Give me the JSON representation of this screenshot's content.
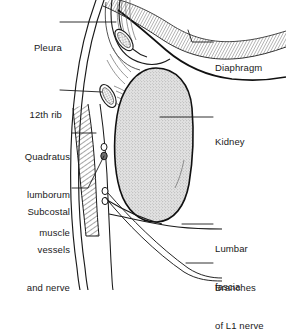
{
  "figure": {
    "background_color": "#ffffff",
    "ink_color": "#1a1a1a",
    "kidney_fill_color": "#d9d9d9",
    "width": 286,
    "height": 290
  },
  "labels": {
    "pleura": {
      "text": "Pleura",
      "lines": [
        "Pleura"
      ],
      "align": "right",
      "x": 8,
      "y": 17,
      "width": 54
    },
    "twelfth_rib": {
      "text": "12th rib",
      "lines": [
        "12th rib"
      ],
      "align": "right",
      "x": 8,
      "y": 84,
      "width": 54
    },
    "quadratus_lumborum": {
      "text": "Quadratus lumborum muscle",
      "lines": [
        "Quadratus",
        "lumborum",
        "muscle"
      ],
      "align": "right",
      "x": 0,
      "y": 126,
      "width": 70
    },
    "subcostal": {
      "text": "Subcostal vessels and nerve",
      "lines": [
        "Subcostal",
        "vessels",
        "and nerve"
      ],
      "align": "right",
      "x": 0,
      "y": 181,
      "width": 70
    },
    "diaphragm": {
      "text": "Diaphragm",
      "lines": [
        "Diaphragm"
      ],
      "align": "left",
      "x": 215,
      "y": 37,
      "width": 70
    },
    "kidney": {
      "text": "Kidney",
      "lines": [
        "Kidney"
      ],
      "align": "left",
      "x": 215,
      "y": 111,
      "width": 70
    },
    "lumbar_fascia": {
      "text": "Lumbar fascia",
      "lines": [
        "Lumbar",
        "fascia"
      ],
      "align": "left",
      "x": 215,
      "y": 218,
      "width": 70
    },
    "branches_l1": {
      "text": "Branches of L1 nerve",
      "lines": [
        "Branches",
        "of L1 nerve"
      ],
      "align": "left",
      "x": 215,
      "y": 257,
      "width": 72
    }
  },
  "structures": [
    {
      "name": "pleura",
      "kind": "membrane-line",
      "description": "pleural reflection line descending obliquely"
    },
    {
      "name": "diaphragm",
      "kind": "hatched-band",
      "description": "hatched muscular band sweeping from upper-left to right"
    },
    {
      "name": "eleventh-rib",
      "kind": "bone-cross-section",
      "description": "small stippled oval rib cross-section, upper"
    },
    {
      "name": "twelfth-rib",
      "kind": "bone-cross-section",
      "description": "small stippled oval rib cross-section, lower"
    },
    {
      "name": "kidney",
      "kind": "stippled-organ",
      "description": "large stippled kidney outline"
    },
    {
      "name": "quadratus-lumborum-muscle",
      "kind": "hatched-band",
      "description": "diagonally hatched vertical muscle band on left"
    },
    {
      "name": "subcostal-vessels-and-nerve",
      "kind": "small-circles",
      "description": "paired small circles in the wall"
    },
    {
      "name": "branches-of-l1-nerve",
      "kind": "small-circles",
      "description": "paired small circles lower in the wall"
    },
    {
      "name": "lumbar-fascia",
      "kind": "fascial-line",
      "description": "fascial lines running medially from the wall"
    }
  ],
  "leader_lines": {
    "pleura": "from label to pleural reflection near upper rib",
    "twelfth_rib": "from label to 12th rib cross-section",
    "quadratus_lumborum": "from label to hatched muscle band",
    "subcostal": "from label to small vessel circles",
    "diaphragm": "from label to hatched diaphragm band",
    "kidney": "from label to kidney substance",
    "lumbar_fascia": "from label to fascial line",
    "branches_l1": "from label to lower nerve circles"
  }
}
